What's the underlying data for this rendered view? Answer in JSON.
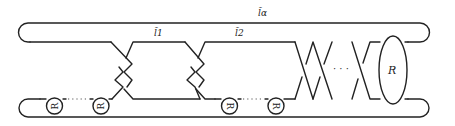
{
  "diagram": {
    "type": "link-diagram",
    "labels": {
      "top_strand": "l̃α",
      "arc_1": "l̃1",
      "arc_2": "l̃2",
      "box": "R"
    },
    "circle_label": "R",
    "circles": [
      {
        "label": "R",
        "rotation": -90
      },
      {
        "label": "R",
        "rotation": -90
      },
      {
        "label": "R",
        "rotation": 90
      },
      {
        "label": "R",
        "rotation": 90
      }
    ],
    "ellipsis": "· · ·",
    "colors": {
      "stroke": "#222222",
      "background": "#ffffff"
    }
  }
}
